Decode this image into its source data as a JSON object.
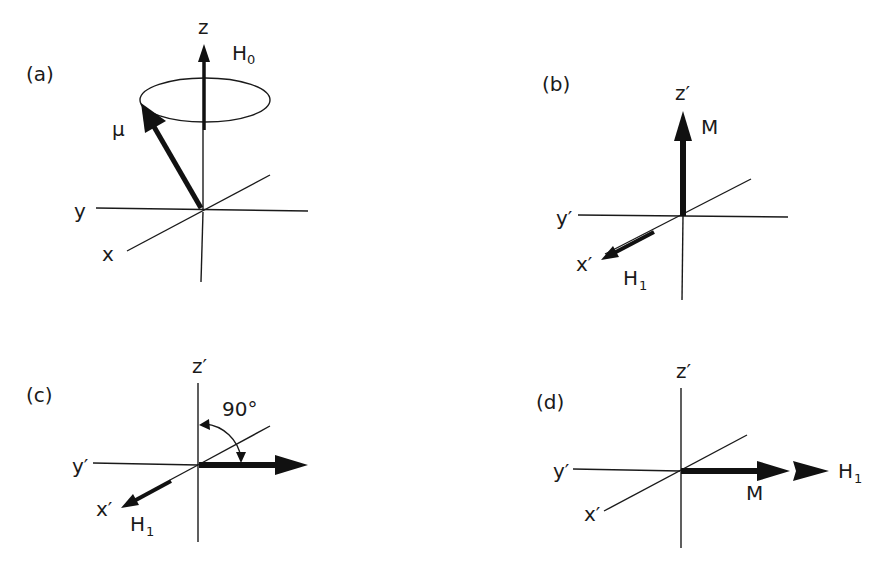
{
  "figure": {
    "panels": [
      {
        "id": "a",
        "label": "(a)",
        "frame": "laboratory",
        "axes": {
          "z": "z",
          "y": "y",
          "x": "x"
        },
        "vectors": [
          {
            "name": "H",
            "subscript": "0",
            "direction": "+z"
          },
          {
            "name": "μ",
            "direction": "tilted from z, precessing on cone"
          }
        ],
        "annotations": [
          "precession ellipse around z axis"
        ]
      },
      {
        "id": "b",
        "label": "(b)",
        "frame": "rotating",
        "axes": {
          "z": "z′",
          "y": "y′",
          "x": "x′"
        },
        "vectors": [
          {
            "name": "M",
            "direction": "+z′"
          },
          {
            "name": "H",
            "subscript": "1",
            "direction": "+x′"
          }
        ]
      },
      {
        "id": "c",
        "label": "(c)",
        "frame": "rotating",
        "axes": {
          "z": "z′",
          "y": "y′",
          "x": "x′"
        },
        "vectors": [
          {
            "name": "M",
            "direction": "rotated 90° from z′ into the plane"
          },
          {
            "name": "H",
            "subscript": "1",
            "direction": "+x′"
          }
        ],
        "annotations": [
          "90°"
        ]
      },
      {
        "id": "d",
        "label": "(d)",
        "frame": "rotating",
        "axes": {
          "z": "z′",
          "y": "y′",
          "x": "x′"
        },
        "vectors": [
          {
            "name": "M",
            "direction": "horizontal right"
          },
          {
            "name": "H",
            "subscript": "1",
            "direction": "horizontal right"
          }
        ]
      }
    ]
  },
  "text": {
    "a": {
      "label": "(a)",
      "z": "z",
      "H": "H",
      "H_sub": "0",
      "mu": "μ",
      "y": "y",
      "x": "x"
    },
    "b": {
      "label": "(b)",
      "z": "z′",
      "M": "M",
      "y": "y′",
      "x": "x′",
      "H": "H",
      "H_sub": "1"
    },
    "c": {
      "label": "(c)",
      "z": "z′",
      "angle": "90°",
      "y": "y′",
      "x": "x′",
      "H": "H",
      "H_sub": "1"
    },
    "d": {
      "label": "(d)",
      "z": "z′",
      "y": "y′",
      "x": "x′",
      "M": "M",
      "H": "H",
      "H_sub": "1"
    }
  },
  "colors": {
    "ink": "#1a1a1a",
    "background": "#ffffff"
  }
}
